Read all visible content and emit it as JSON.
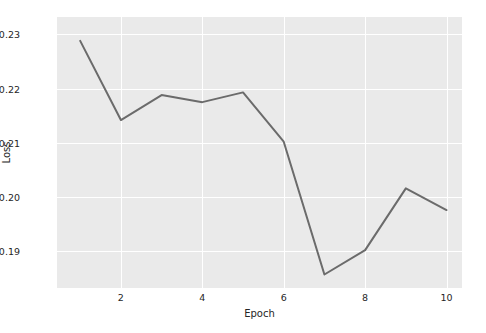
{
  "chart_data": {
    "type": "line",
    "title": "",
    "xlabel": "Epoch",
    "ylabel": "Loss",
    "x": [
      1,
      2,
      3,
      4,
      5,
      6,
      7,
      8,
      9,
      10
    ],
    "values": [
      0.2288,
      0.2142,
      0.2188,
      0.2175,
      0.2193,
      0.2102,
      0.1857,
      0.1902,
      0.2016,
      0.1976
    ],
    "series": [
      {
        "name": "Loss",
        "values": [
          0.2288,
          0.2142,
          0.2188,
          0.2175,
          0.2193,
          0.2102,
          0.1857,
          0.1902,
          0.2016,
          0.1976
        ]
      }
    ],
    "xtick_labels": [
      "2",
      "4",
      "6",
      "8",
      "10"
    ],
    "xticks": [
      2,
      4,
      6,
      8,
      10
    ],
    "ytick_labels": [
      "0.23",
      "0.22",
      "0.21",
      "0.20",
      "0.19"
    ],
    "yticks": [
      0.23,
      0.22,
      0.21,
      0.2,
      0.19
    ],
    "xlim": [
      0.43,
      10.38
    ],
    "ylim": [
      0.18321,
      0.23321
    ],
    "grid": true,
    "legend": null,
    "line_color": "#6b6b6b",
    "line_width": 2.0,
    "plot_background": "#eaeaea",
    "figure_background": "#ffffff",
    "gridline_color": "#ffffff",
    "tick_label_color": "#262626"
  }
}
